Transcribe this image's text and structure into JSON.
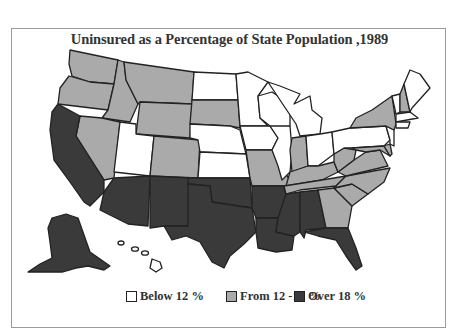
{
  "title": "Uninsured as a Percentage of State Population ,1989",
  "colors": {
    "below": "#ffffff",
    "mid": "#aaaaaa",
    "over": "#3a3a3a",
    "border": "#222222",
    "frame": "#9a9a9a"
  },
  "legend": [
    {
      "label": "Below 12 %",
      "color": "#ffffff"
    },
    {
      "label": "From 12 -18 %",
      "color": "#aaaaaa"
    },
    {
      "label": "Over 18 %",
      "color": "#3a3a3a"
    }
  ],
  "categories": {
    "Below 12 %": [
      "UT",
      "ND",
      "NE",
      "KS",
      "MN",
      "WI",
      "IA",
      "IL",
      "MI",
      "OH",
      "PA",
      "ME",
      "VT",
      "MA",
      "CT",
      "RI",
      "NJ",
      "HI"
    ],
    "From 12 -18 %": [
      "WA",
      "OR",
      "ID",
      "MT",
      "WY",
      "NV",
      "CO",
      "SD",
      "MO",
      "IN",
      "KY",
      "TN",
      "WV",
      "VA",
      "NC",
      "SC",
      "GA",
      "NY",
      "NH",
      "MD",
      "DE"
    ],
    "Over 18 %": [
      "CA",
      "AZ",
      "NM",
      "TX",
      "OK",
      "AR",
      "LA",
      "MS",
      "AL",
      "FL",
      "AK"
    ]
  }
}
